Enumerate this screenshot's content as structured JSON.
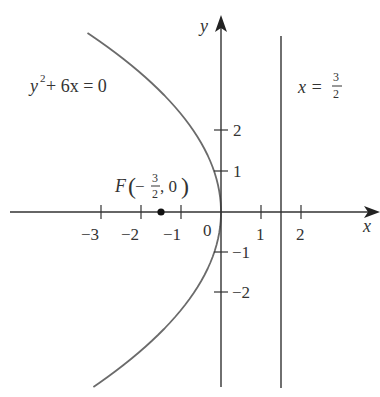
{
  "diagram": {
    "equation_label": {
      "base": "y",
      "sup": "2",
      "rest": " + 6x = 0"
    },
    "directrix_label": {
      "lhs": "x = ",
      "num": "3",
      "den": "2"
    },
    "focus_label": {
      "name": "F",
      "open": "(",
      "minus": "−",
      "num": "3",
      "den": "2",
      "rest": ", 0",
      "close": ")"
    },
    "axis_x_label": "x",
    "axis_y_label": "y",
    "origin_label": "0",
    "x_ticks": [
      "−3",
      "−2",
      "−1",
      "1",
      "2"
    ],
    "y_ticks": [
      "2",
      "1",
      "−1",
      "−2"
    ],
    "colors": {
      "curve": "#6b6b6b",
      "axis": "#333333",
      "text": "#333333"
    }
  }
}
